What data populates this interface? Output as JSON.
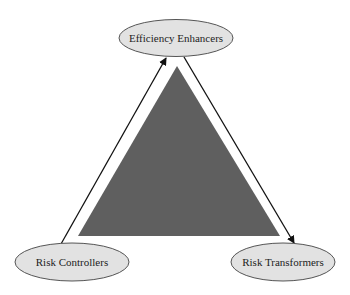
{
  "diagram": {
    "type": "triangle-cycle",
    "colors": {
      "triangle_fill": "#5f5f5f",
      "node_fill": "#e2e2e2",
      "node_stroke": "#555555",
      "arrow": "#111111",
      "text": "#222222",
      "background": "#ffffff"
    },
    "nodes": [
      {
        "id": "top",
        "label": "Efficiency Enhancers",
        "position": "top"
      },
      {
        "id": "bottom_left",
        "label": "Risk Controllers",
        "position": "bottom-left"
      },
      {
        "id": "bottom_right",
        "label": "Risk Transformers",
        "position": "bottom-right"
      }
    ],
    "edges": [
      {
        "from": "Risk Controllers",
        "to": "Efficiency Enhancers",
        "style": "arrow"
      },
      {
        "from": "Efficiency Enhancers",
        "to": "Risk Transformers",
        "style": "arrow"
      }
    ]
  }
}
